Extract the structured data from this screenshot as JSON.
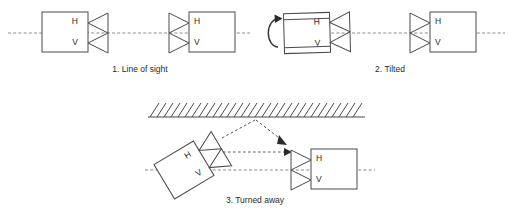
{
  "diagram": {
    "colors": {
      "background": "#ffffff",
      "stroke": "#4a4a4a",
      "text": "#2b2b2b",
      "sight_line": "#8a8a8a",
      "ray": "#5a5a5a",
      "arrowhead": "#2b2b2b"
    },
    "labels": {
      "horizontal": "H",
      "vertical": "V"
    }
  },
  "panels": [
    {
      "id": "panel-1",
      "caption": "1. Line of sight",
      "left_unit": {
        "name": "transmitter-unit",
        "h_label": "H",
        "v_label": "V",
        "orientation": "upright",
        "antenna_side": "right"
      },
      "right_unit": {
        "name": "receiver-unit",
        "h_label": "H",
        "v_label": "V",
        "orientation": "upright",
        "antenna_side": "left"
      },
      "sight_line": "dash-dot"
    },
    {
      "id": "panel-2",
      "caption": "2. Tilted",
      "left_unit": {
        "name": "transmitter-unit",
        "h_label": "H",
        "v_label": "V",
        "orientation": "tilted",
        "antenna_side": "right",
        "rotation_indicator": "counter-clockwise-arc"
      },
      "right_unit": {
        "name": "receiver-unit",
        "h_label": "H",
        "v_label": "V",
        "orientation": "upright",
        "antenna_side": "left"
      },
      "sight_line": "dash-dot"
    },
    {
      "id": "panel-3",
      "caption": "3. Turned away",
      "left_unit": {
        "name": "transmitter-unit",
        "h_label": "H",
        "v_label": "V",
        "orientation": "rotated",
        "antenna_side": "right"
      },
      "right_unit": {
        "name": "receiver-unit",
        "h_label": "H",
        "v_label": "V",
        "orientation": "upright",
        "antenna_side": "left"
      },
      "wall": {
        "name": "reflecting-surface",
        "style": "hatched"
      },
      "rays": [
        {
          "name": "reflected-ray",
          "style": "dotted-arrow"
        },
        {
          "name": "direct-ray",
          "style": "dotted-arrow"
        }
      ],
      "sight_line": "dash-dot"
    }
  ]
}
